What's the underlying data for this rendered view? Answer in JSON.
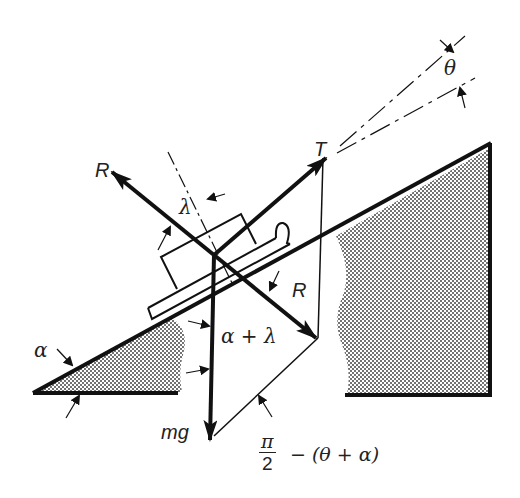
{
  "diagram": {
    "labels": {
      "theta": "θ",
      "T": "T",
      "R_upper": "R",
      "R_lower": "R",
      "lambda": "λ",
      "alpha": "α",
      "alpha_plus_lambda": "α + λ",
      "mg": "mg",
      "pi": "π",
      "two": "2",
      "minus_theta_alpha": "− (θ + α)"
    },
    "forces": [
      {
        "name": "T",
        "description": "tension, at angle θ above incline"
      },
      {
        "name": "R",
        "description": "total reaction, at angle λ from normal"
      },
      {
        "name": "mg",
        "description": "weight, vertical downward"
      }
    ],
    "angles": [
      "α",
      "θ",
      "λ",
      "α + λ",
      "π/2 − (θ + α)"
    ]
  }
}
